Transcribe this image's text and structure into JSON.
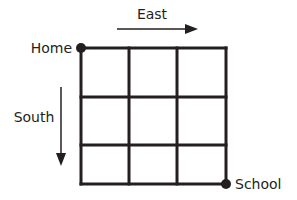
{
  "diagram": {
    "type": "grid-route",
    "grid": {
      "rows": 3,
      "cols": 3,
      "x_lines": [
        81,
        129,
        177,
        226
      ],
      "y_lines": [
        48,
        97,
        145,
        184
      ],
      "line_color": "#231f20"
    },
    "points": {
      "start": {
        "label": "Home",
        "corner": "top-left"
      },
      "end": {
        "label": "School",
        "corner": "bottom-right"
      }
    },
    "arrows": {
      "east": {
        "label": "East",
        "direction": "right"
      },
      "south": {
        "label": "South",
        "direction": "down"
      }
    }
  }
}
